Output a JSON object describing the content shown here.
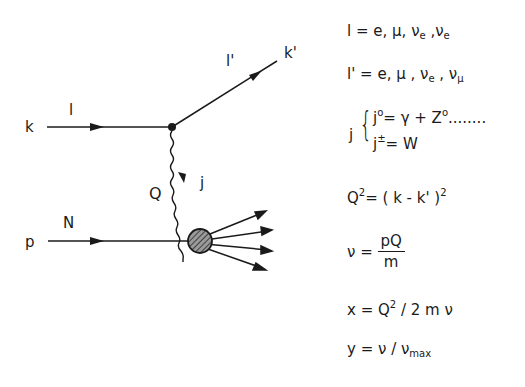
{
  "diagram": {
    "labels": {
      "k": "k",
      "l": "l",
      "l_prime": "l'",
      "k_prime": "k'",
      "Q": "Q",
      "j": "j",
      "p": "p",
      "N": "N"
    },
    "colors": {
      "ink": "#1a1a1a",
      "blob_fill": "#6a6a6a",
      "background": "#ffffff"
    }
  },
  "equations": {
    "lepton_in": {
      "lhs": "l",
      "rhs": "= e, μ, ν",
      "sub1": "e",
      "sep": " ,ν",
      "sub2": "e"
    },
    "lepton_out": {
      "lhs": "l'",
      "rhs": "= e, μ , ν",
      "sub1": "e",
      "sep": " , ν",
      "sub2": "μ"
    },
    "current": {
      "symbol": "j",
      "neutral": {
        "lhs": "j",
        "sup": "o",
        "rhs": "=  γ + Z",
        "sup2": "o",
        "tail": "........"
      },
      "charged": {
        "lhs": "j",
        "sup": "±",
        "rhs": "= W"
      }
    },
    "q2": {
      "lhs": "Q",
      "sup": "2",
      "rhs": "= ( k - k' )",
      "sup2": "2"
    },
    "nu": {
      "lhs": "ν  =",
      "num": "pQ",
      "den": "m"
    },
    "x": {
      "lhs": "x  = Q",
      "sup": "2",
      "rhs": " / 2 m ν"
    },
    "y": {
      "lhs": "y  = ν /  ν",
      "sub": "max"
    }
  }
}
